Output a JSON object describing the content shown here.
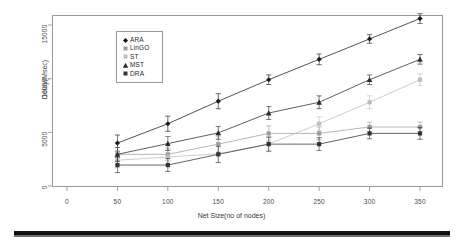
{
  "chart_data": {
    "type": "line",
    "title": "",
    "xlabel": "Net Size(no of nodes)",
    "ylabel": "Delay(Msec)",
    "x": [
      50,
      100,
      150,
      200,
      250,
      300,
      350
    ],
    "xticks": [
      0,
      50,
      100,
      150,
      200,
      250,
      300,
      350
    ],
    "yticks": [
      0,
      5000,
      10000,
      15000
    ],
    "xlim": [
      0,
      365
    ],
    "ylim": [
      0,
      16800
    ],
    "grid": false,
    "legend_position": "upper-left-inside",
    "error_bars": true,
    "series": [
      {
        "name": "ARA",
        "marker": "diamond",
        "color": "#1a1a1a",
        "values": [
          4000,
          5800,
          7900,
          9900,
          11800,
          13700,
          15600
        ],
        "errors": [
          750,
          700,
          700,
          450,
          500,
          400,
          450
        ]
      },
      {
        "name": "LinGO",
        "marker": "square",
        "color": "#9e9e9e",
        "values": [
          2950,
          2950,
          3900,
          4900,
          4900,
          5500,
          5500
        ],
        "errors": [
          650,
          600,
          750,
          700,
          600,
          450,
          450
        ]
      },
      {
        "name": "ST",
        "marker": "square",
        "color": "#bdbdbd",
        "values": [
          2400,
          2700,
          3000,
          3900,
          5800,
          7800,
          9900
        ],
        "errors": [
          700,
          700,
          800,
          700,
          650,
          600,
          550
        ]
      },
      {
        "name": "MST",
        "marker": "triangle",
        "color": "#2b2b2b",
        "values": [
          2950,
          3950,
          4950,
          6800,
          7800,
          9900,
          11800
        ],
        "errors": [
          650,
          650,
          600,
          600,
          600,
          450,
          450
        ]
      },
      {
        "name": "DRA",
        "marker": "square",
        "color": "#333333",
        "values": [
          1950,
          1950,
          2950,
          3900,
          3900,
          4900,
          4900
        ],
        "errors": [
          700,
          600,
          750,
          650,
          600,
          500,
          550
        ]
      }
    ]
  },
  "axis": {
    "x_tick_labels": [
      "0",
      "50",
      "100",
      "150",
      "200",
      "250",
      "300",
      "350"
    ],
    "y_tick_labels": [
      "0",
      "5000",
      "10000",
      "15000"
    ],
    "x_title": "Net Size(no of nodes)",
    "y_title": "Delay(Msec)"
  },
  "legend": {
    "entries": [
      {
        "label": "ARA",
        "marker": "diamond",
        "color": "#1a1a1a"
      },
      {
        "label": "LinGO",
        "marker": "square",
        "color": "#9e9e9e"
      },
      {
        "label": "ST",
        "marker": "square",
        "color": "#bdbdbd"
      },
      {
        "label": "MST",
        "marker": "triangle",
        "color": "#2b2b2b"
      },
      {
        "label": "DRA",
        "marker": "square",
        "color": "#333333"
      }
    ]
  }
}
